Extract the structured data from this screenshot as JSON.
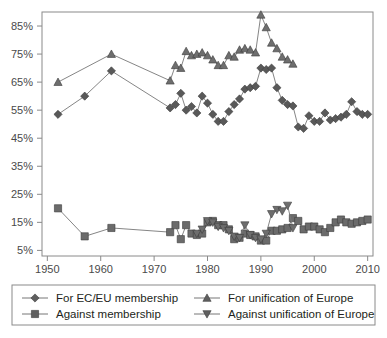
{
  "chart_data": {
    "type": "line",
    "title": "",
    "xlabel": "",
    "ylabel": "",
    "xlim": [
      1949,
      2011
    ],
    "ylim": [
      3,
      90
    ],
    "grid": false,
    "legend_position": "bottom",
    "xticks": [
      1950,
      1960,
      1970,
      1980,
      1990,
      2000,
      2010
    ],
    "xtick_labels": [
      "1950",
      "1960",
      "1970",
      "1980",
      "1990",
      "2000",
      "2010"
    ],
    "yticks": [
      5,
      15,
      25,
      35,
      45,
      55,
      65,
      75,
      85
    ],
    "ytick_labels": [
      "5%",
      "15%",
      "25%",
      "35%",
      "45%",
      "55%",
      "65%",
      "75%",
      "85%"
    ],
    "series": [
      {
        "name": "For EC/EU membership",
        "marker": "diamond",
        "color": "#595959",
        "points": [
          [
            1952,
            53.5
          ],
          [
            1957,
            60.0
          ],
          [
            1962,
            69.0
          ],
          [
            1973,
            55.8
          ],
          [
            1974,
            57.0
          ],
          [
            1975,
            61.0
          ],
          [
            1976,
            55.0
          ],
          [
            1977,
            56.3
          ],
          [
            1978,
            54.0
          ],
          [
            1979,
            60.0
          ],
          [
            1980,
            57.5
          ],
          [
            1981,
            53.5
          ],
          [
            1982,
            51.0
          ],
          [
            1983,
            51.0
          ],
          [
            1984,
            54.5
          ],
          [
            1985,
            57.0
          ],
          [
            1986,
            59.0
          ],
          [
            1987,
            62.5
          ],
          [
            1988,
            63.0
          ],
          [
            1989,
            63.5
          ],
          [
            1990,
            70.0
          ],
          [
            1991,
            69.5
          ],
          [
            1992,
            70.0
          ],
          [
            1993,
            63.0
          ],
          [
            1994,
            58.5
          ],
          [
            1995,
            57.0
          ],
          [
            1996,
            56.5
          ],
          [
            1997,
            49.0
          ],
          [
            1998,
            48.5
          ],
          [
            1999,
            53.0
          ],
          [
            2000,
            51.0
          ],
          [
            2001,
            51.0
          ],
          [
            2002,
            54.0
          ],
          [
            2003,
            51.5
          ],
          [
            2004,
            52.0
          ],
          [
            2005,
            52.5
          ],
          [
            2006,
            53.5
          ],
          [
            2007,
            58.0
          ],
          [
            2008,
            54.5
          ],
          [
            2009,
            53.5
          ],
          [
            2010,
            53.5
          ]
        ]
      },
      {
        "name": "Against membership",
        "marker": "square",
        "color": "#6b6b6b",
        "points": [
          [
            1952,
            20.0
          ],
          [
            1957,
            10.0
          ],
          [
            1962,
            13.0
          ],
          [
            1973,
            11.5
          ],
          [
            1974,
            14.0
          ],
          [
            1975,
            9.0
          ],
          [
            1976,
            14.0
          ],
          [
            1977,
            11.0
          ],
          [
            1978,
            10.5
          ],
          [
            1979,
            11.0
          ],
          [
            1980,
            15.0
          ],
          [
            1981,
            15.5
          ],
          [
            1982,
            14.0
          ],
          [
            1983,
            14.0
          ],
          [
            1984,
            12.5
          ],
          [
            1985,
            9.0
          ],
          [
            1986,
            9.5
          ],
          [
            1987,
            11.0
          ],
          [
            1988,
            10.5
          ],
          [
            1989,
            10.0
          ],
          [
            1990,
            8.5
          ],
          [
            1991,
            8.5
          ],
          [
            1992,
            12.0
          ],
          [
            1993,
            12.0
          ],
          [
            1994,
            12.5
          ],
          [
            1995,
            13.0
          ],
          [
            1996,
            16.5
          ],
          [
            1997,
            15.5
          ],
          [
            1998,
            12.5
          ],
          [
            1999,
            13.5
          ],
          [
            2000,
            13.5
          ],
          [
            2001,
            12.5
          ],
          [
            2002,
            11.5
          ],
          [
            2003,
            13.0
          ],
          [
            2004,
            15.0
          ],
          [
            2005,
            16.0
          ],
          [
            2006,
            15.0
          ],
          [
            2007,
            14.5
          ],
          [
            2008,
            15.0
          ],
          [
            2009,
            15.5
          ],
          [
            2010,
            16.0
          ]
        ]
      },
      {
        "name": "For unification of Europe",
        "marker": "triangle-up",
        "color": "#6e6e6e",
        "points": [
          [
            1952,
            65.0
          ],
          [
            1962,
            75.0
          ],
          [
            1973,
            65.5
          ],
          [
            1974,
            71.0
          ],
          [
            1975,
            70.0
          ],
          [
            1976,
            76.0
          ],
          [
            1977,
            74.5
          ],
          [
            1978,
            75.0
          ],
          [
            1979,
            75.5
          ],
          [
            1980,
            74.5
          ],
          [
            1981,
            73.0
          ],
          [
            1982,
            71.0
          ],
          [
            1983,
            71.0
          ],
          [
            1984,
            74.5
          ],
          [
            1985,
            74.0
          ],
          [
            1986,
            76.5
          ],
          [
            1987,
            77.0
          ],
          [
            1988,
            76.5
          ],
          [
            1989,
            75.5
          ],
          [
            1990,
            89.0
          ],
          [
            1991,
            84.5
          ],
          [
            1992,
            79.0
          ],
          [
            1993,
            77.0
          ],
          [
            1994,
            74.0
          ],
          [
            1995,
            73.0
          ],
          [
            1996,
            71.5
          ]
        ]
      },
      {
        "name": "Against unification of Europe",
        "marker": "triangle-down",
        "color": "#6e6e6e",
        "points": [
          [
            1978,
            11.0
          ],
          [
            1979,
            12.5
          ],
          [
            1980,
            15.5
          ],
          [
            1981,
            15.0
          ],
          [
            1982,
            13.5
          ],
          [
            1983,
            13.0
          ],
          [
            1984,
            12.0
          ],
          [
            1985,
            10.0
          ],
          [
            1986,
            9.5
          ],
          [
            1987,
            14.0
          ],
          [
            1988,
            10.5
          ],
          [
            1989,
            9.5
          ],
          [
            1990,
            9.0
          ],
          [
            1991,
            11.0
          ],
          [
            1992,
            18.0
          ],
          [
            1993,
            19.5
          ],
          [
            1994,
            19.0
          ],
          [
            1995,
            21.0
          ],
          [
            1996,
            13.0
          ]
        ]
      }
    ]
  },
  "legend": {
    "items": [
      {
        "label": "For EC/EU membership",
        "marker": "diamond"
      },
      {
        "label": "Against membership",
        "marker": "square"
      },
      {
        "label": "For unification of Europe",
        "marker": "triangle-up"
      },
      {
        "label": "Against unification of Europe",
        "marker": "triangle-down"
      }
    ]
  }
}
